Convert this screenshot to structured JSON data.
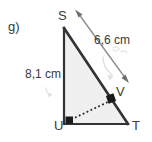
{
  "figure": {
    "item_label": "g)",
    "shape": "right-triangle",
    "fill_color": "#f0f0f0",
    "stroke_color": "#333333",
    "dimension_color": "#777777",
    "faint_color": "#cccccc",
    "vertices": [
      {
        "name": "S",
        "label": "S",
        "x": 64,
        "y": 28
      },
      {
        "name": "U",
        "label": "U",
        "x": 64,
        "y": 124
      },
      {
        "name": "T",
        "label": "T",
        "x": 128,
        "y": 124
      },
      {
        "name": "V",
        "label": "V",
        "x": 113,
        "y": 99
      }
    ],
    "right_angle_markers": [
      {
        "at": "U",
        "x": 64,
        "y": 124
      },
      {
        "at": "V",
        "x": 113,
        "y": 99
      }
    ],
    "dotted_segment": {
      "from": "U",
      "to": "V"
    },
    "dimensions": [
      {
        "name": "hypotenuse-ST",
        "label": "6,6 cm",
        "value": 6.6,
        "unit": "cm",
        "side": "ST"
      },
      {
        "name": "leg-SU",
        "label": "8,1 cm",
        "value": 8.1,
        "unit": "cm",
        "side": "SU"
      }
    ]
  }
}
